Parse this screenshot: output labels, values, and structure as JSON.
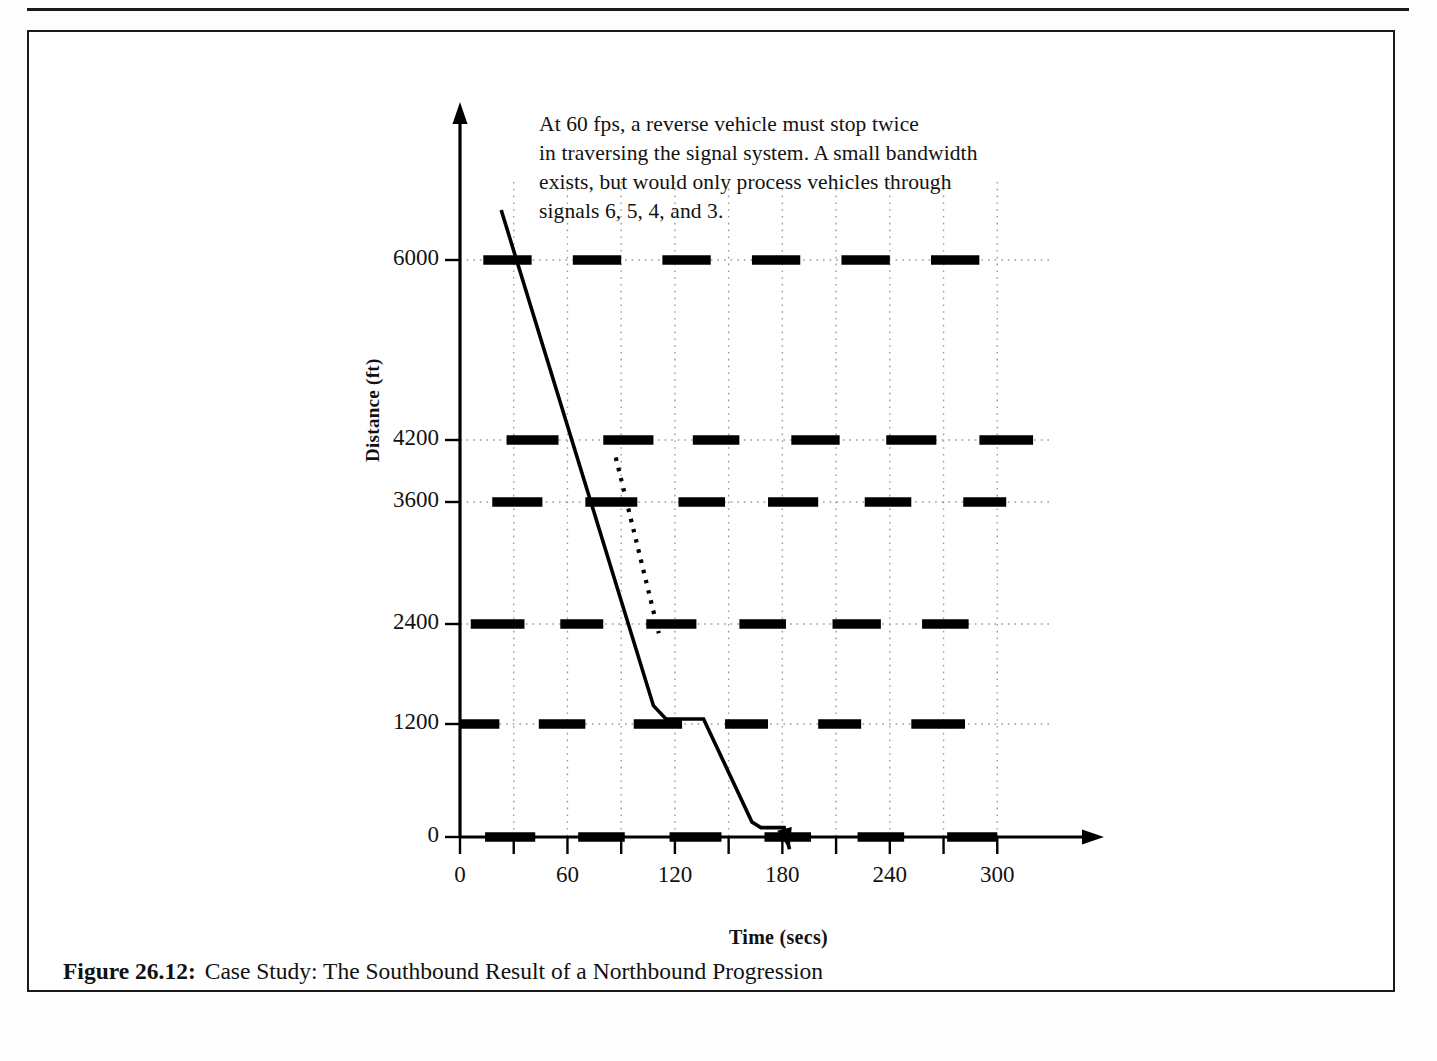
{
  "figure": {
    "caption_number": "Figure 26.12:",
    "caption_text": "Case Study: The Southbound Result of a Northbound Progression"
  },
  "annotation": {
    "line1": "At 60 fps, a reverse vehicle must stop twice",
    "line2": "in traversing the signal system. A small bandwidth",
    "line3": "exists, but would only process vehicles through",
    "line4": "signals 6, 5, 4, and 3."
  },
  "chart_data": {
    "type": "line",
    "title": "Case Study: The Southbound Result of a Northbound Progression",
    "xlabel": "Time (secs)",
    "ylabel": "Distance (ft)",
    "xlim": [
      0,
      330
    ],
    "ylim": [
      0,
      6700
    ],
    "xticks": [
      0,
      60,
      120,
      180,
      240,
      300
    ],
    "xtick_labels": [
      "0",
      "60",
      "120",
      "180",
      "240",
      "300"
    ],
    "xminor_ticks": [
      30,
      90,
      150,
      210,
      270
    ],
    "yticks": [
      0,
      1200,
      2400,
      3600,
      4200,
      6000
    ],
    "ytick_labels": [
      "0",
      "1200",
      "2400",
      "3600",
      "4200",
      "6000"
    ],
    "grid": "dotted",
    "legend": "none",
    "speed_fps": 60,
    "signals": [
      {
        "name": "signal-6",
        "distance_ft": 6000,
        "red_intervals": [
          [
            13,
            40
          ],
          [
            63,
            90
          ],
          [
            113,
            140
          ],
          [
            163,
            190
          ],
          [
            213,
            240
          ],
          [
            263,
            290
          ]
        ]
      },
      {
        "name": "signal-5",
        "distance_ft": 4200,
        "red_intervals": [
          [
            26,
            55
          ],
          [
            80,
            108
          ],
          [
            130,
            156
          ],
          [
            185,
            212
          ],
          [
            238,
            266
          ],
          [
            290,
            320
          ]
        ]
      },
      {
        "name": "signal-4",
        "distance_ft": 3600,
        "red_intervals": [
          [
            18,
            46
          ],
          [
            70,
            99
          ],
          [
            122,
            148
          ],
          [
            172,
            200
          ],
          [
            226,
            252
          ],
          [
            281,
            305
          ]
        ]
      },
      {
        "name": "signal-3",
        "distance_ft": 2400,
        "red_intervals": [
          [
            6,
            36
          ],
          [
            56,
            80
          ],
          [
            104,
            132
          ],
          [
            156,
            182
          ],
          [
            208,
            235
          ],
          [
            258,
            284
          ]
        ]
      },
      {
        "name": "signal-2",
        "distance_ft": 1200,
        "red_intervals": [
          [
            0,
            22
          ],
          [
            44,
            70
          ],
          [
            97,
            124
          ],
          [
            148,
            172
          ],
          [
            200,
            224
          ],
          [
            252,
            282
          ]
        ]
      },
      {
        "name": "signal-1",
        "distance_ft": 0,
        "red_intervals": [
          [
            14,
            42
          ],
          [
            66,
            92
          ],
          [
            117,
            146
          ],
          [
            170,
            196
          ],
          [
            222,
            248
          ],
          [
            272,
            300
          ]
        ]
      }
    ],
    "vehicle_trajectory": {
      "name": "southbound-vehicle",
      "style": "solid",
      "direction": "descending",
      "points": [
        [
          23,
          6500
        ],
        [
          108,
          1420
        ],
        [
          115,
          1260
        ],
        [
          136,
          1260
        ],
        [
          163,
          160
        ],
        [
          168,
          100
        ],
        [
          181,
          100
        ],
        [
          184,
          -130
        ]
      ],
      "stops": [
        {
          "at_time_secs": 115,
          "until_secs": 136,
          "distance_ft": 1260
        },
        {
          "at_time_secs": 168,
          "until_secs": 181,
          "distance_ft": 100
        }
      ],
      "arrow_head": true
    },
    "bandwidth_line": {
      "name": "bandwidth-edge",
      "style": "dotted",
      "points": [
        [
          87,
          4030
        ],
        [
          111,
          2290
        ]
      ]
    }
  }
}
